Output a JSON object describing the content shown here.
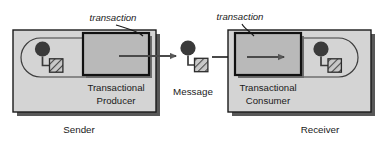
{
  "diagram": {
    "colors": {
      "page_background": "#ffffff",
      "panel_fill": "#d4d4d4",
      "panel_stroke": "#1a1a1a",
      "panel_shadow": "#4a4a4a",
      "transaction_fill": "#b9b9b9",
      "transaction_stroke": "#111111",
      "pill_stroke": "#3d3d3d",
      "icon_circle_fill": "#3a3a3a",
      "icon_square_fill": "#c9c9c9",
      "icon_square_stroke": "#2b2b2b",
      "icon_hatch_stroke": "#3a3a3a",
      "arrow_fill": "#5a5a5a",
      "arrow_stroke": "#3a3a3a",
      "leader_stroke": "#1a1a1a",
      "text": "#1a1a1a"
    },
    "sender": {
      "panel_name": "sender-panel",
      "outer_label": "Sender",
      "inner_label_line1": "Transactional",
      "inner_label_line2": "Producer",
      "callout_label": "transaction",
      "icon_name": "producer-session-icon",
      "transaction_position": "right"
    },
    "message": {
      "label": "Message",
      "icon_name": "message-icon"
    },
    "receiver": {
      "panel_name": "receiver-panel",
      "outer_label": "Receiver",
      "inner_label_line1": "Transactional",
      "inner_label_line2": "Consumer",
      "callout_label": "transaction",
      "icon_name": "consumer-session-icon",
      "transaction_position": "left"
    },
    "flow": {
      "producer_to_message_arrow": "arrow-producer-to-message",
      "message_to_consumer_arrow": "arrow-message-to-consumer"
    }
  }
}
